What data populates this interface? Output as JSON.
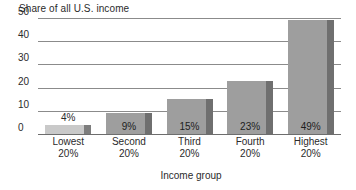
{
  "chart_data": {
    "type": "bar",
    "title": "Share of all U.S. income",
    "xlabel": "Income group",
    "ylabel": "",
    "categories": [
      "Lowest 20%",
      "Second 20%",
      "Third 20%",
      "Fourth 20%",
      "Highest 20%"
    ],
    "category_lines": [
      {
        "line1": "Lowest",
        "line2": "20%"
      },
      {
        "line1": "Second",
        "line2": "20%"
      },
      {
        "line1": "Third",
        "line2": "20%"
      },
      {
        "line1": "Fourth",
        "line2": "20%"
      },
      {
        "line1": "Highest",
        "line2": "20%"
      }
    ],
    "values": [
      4,
      9,
      15,
      23,
      49
    ],
    "data_labels": [
      "4%",
      "9%",
      "15%",
      "23%",
      "49%"
    ],
    "ylim": [
      0,
      50
    ],
    "yticks": [
      0,
      10,
      20,
      30,
      40,
      50
    ],
    "ytick_labels": [
      "0",
      "10",
      "20",
      "30",
      "40",
      "50"
    ],
    "grid": true,
    "legend": "none",
    "bar_colors": [
      "#c9c9c9",
      "#9e9e9e",
      "#9e9e9e",
      "#9e9e9e",
      "#9e9e9e"
    ],
    "bar_edge_colors": [
      "#7d7d7d",
      "#6f6f6f",
      "#6f6f6f",
      "#6f6f6f",
      "#6f6f6f"
    ],
    "gridline_color": "#8b8b8b",
    "background_color": "#ffffff",
    "text_color": "#2b2b2b"
  }
}
